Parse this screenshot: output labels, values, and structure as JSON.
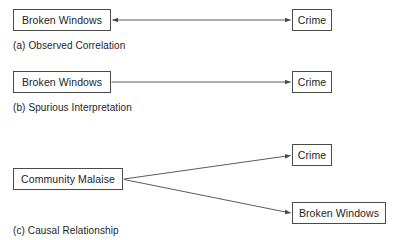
{
  "figure": {
    "background_color": "#ffffff",
    "line_color": "#4a4a4a",
    "text_color": "#232323",
    "panels": [
      {
        "id": "a",
        "caption": "(a) Observed Correlation",
        "nodes": [
          {
            "id": "a-left",
            "label": "Broken Windows"
          },
          {
            "id": "a-right",
            "label": "Crime"
          }
        ],
        "edges": [
          {
            "from": "a-left",
            "to": "a-right",
            "arrowheads": "both",
            "style": "straight"
          }
        ]
      },
      {
        "id": "b",
        "caption": "(b) Spurious Interpretation",
        "nodes": [
          {
            "id": "b-left",
            "label": "Broken Windows"
          },
          {
            "id": "b-right",
            "label": "Crime"
          }
        ],
        "edges": [
          {
            "from": "b-left",
            "to": "b-right",
            "arrowheads": "end",
            "style": "straight"
          }
        ]
      },
      {
        "id": "c",
        "caption": "(c) Causal Relationship",
        "nodes": [
          {
            "id": "c-source",
            "label": "Community Malaise"
          },
          {
            "id": "c-top",
            "label": "Crime"
          },
          {
            "id": "c-bottom",
            "label": "Broken Windows"
          }
        ],
        "edges": [
          {
            "from": "c-source",
            "to": "c-top",
            "arrowheads": "end",
            "style": "diagonal-up"
          },
          {
            "from": "c-source",
            "to": "c-bottom",
            "arrowheads": "end",
            "style": "diagonal-down"
          }
        ]
      }
    ]
  }
}
